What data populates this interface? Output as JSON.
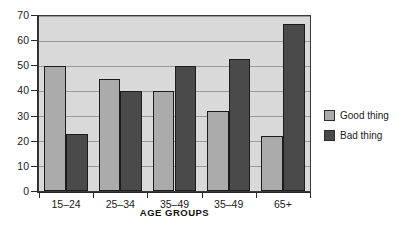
{
  "chart_data": {
    "type": "bar",
    "title": "",
    "xlabel": "AGE GROUPS",
    "ylabel": "",
    "categories": [
      "15–24",
      "25–34",
      "35–49",
      "35–49",
      "65+"
    ],
    "series": [
      {
        "name": "Good thing",
        "color": "#ababab",
        "values": [
          50,
          45,
          40,
          32,
          22
        ]
      },
      {
        "name": "Bad thing",
        "color": "#4a4a4a",
        "values": [
          23,
          40,
          50,
          53,
          67
        ]
      }
    ],
    "ylim": [
      0,
      70
    ],
    "yticks": [
      0,
      10,
      20,
      30,
      40,
      50,
      60,
      70
    ],
    "ytick_labels": [
      "0",
      "10",
      "20",
      "30",
      "40",
      "50",
      "60",
      "70"
    ],
    "grid": true,
    "legend_position": "right",
    "plot_background": "#d9d9d9",
    "frame_color": "#3a3a3a"
  },
  "legend": {
    "items": [
      {
        "label": "Good thing",
        "swatch": "good"
      },
      {
        "label": "Bad thing",
        "swatch": "bad"
      }
    ]
  }
}
